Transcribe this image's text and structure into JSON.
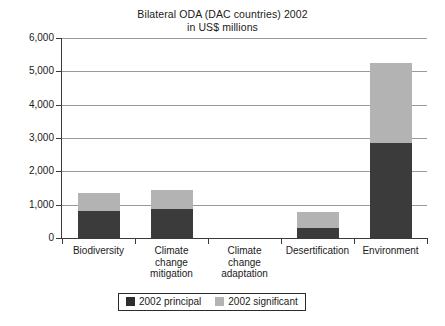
{
  "chart_data": {
    "type": "bar",
    "title": "Bilateral ODA (DAC countries) 2002",
    "subtitle": "in US$ millions",
    "xlabel": "",
    "ylabel": "",
    "ylim": [
      0,
      6000
    ],
    "ytick_labels": [
      "0",
      "1,000",
      "2,000",
      "3,000",
      "4,000",
      "5,000",
      "6,000"
    ],
    "ytick_values": [
      0,
      1000,
      2000,
      3000,
      4000,
      5000,
      6000
    ],
    "grid": true,
    "stacked": true,
    "legend_position": "bottom",
    "categories": [
      "Biodiversity",
      "Climate change mitigation",
      "Climate change adaptation",
      "Desertification",
      "Environment"
    ],
    "category_lines": [
      [
        "Biodiversity"
      ],
      [
        "Climate",
        "change",
        "mitigation"
      ],
      [
        "Climate",
        "change",
        "adaptation"
      ],
      [
        "Desertification"
      ],
      [
        "Environment"
      ]
    ],
    "series": [
      {
        "name": "2002 principal",
        "color": "#3b3b3b",
        "values": [
          810,
          880,
          0,
          300,
          2850
        ]
      },
      {
        "name": "2002 significant",
        "color": "#b3b3b3",
        "values": [
          540,
          560,
          0,
          480,
          2400
        ]
      }
    ],
    "totals": [
      1350,
      1440,
      0,
      780,
      5250
    ]
  },
  "legend": {
    "items": [
      {
        "label": "2002 principal",
        "swatch": "swatch-principal"
      },
      {
        "label": "2002 significant",
        "swatch": "swatch-significant"
      }
    ]
  }
}
